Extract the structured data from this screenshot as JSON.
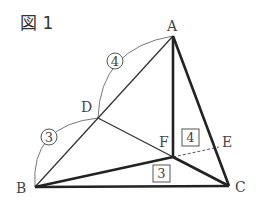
{
  "title": "図 1",
  "points": {
    "A": "A",
    "B": "B",
    "C": "C",
    "D": "D",
    "E": "E",
    "F": "F"
  },
  "ratios": {
    "AD": "4",
    "DB": "3"
  },
  "areas": {
    "AFC_region": "4",
    "BFC_region": "3"
  },
  "colors": {
    "line": "#222222",
    "thin": "#333333",
    "arc": "#666666"
  }
}
